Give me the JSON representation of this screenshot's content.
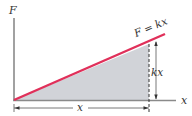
{
  "diagram": {
    "labels": {
      "y_axis": "F",
      "x_axis": "x",
      "line_equation": "F = kx",
      "height_dimension": "kx",
      "base_dimension": "x"
    },
    "colors": {
      "line": "#e0305a",
      "fill": "#c9cbd1",
      "axis": "#8a8a8a",
      "dimension": "#333333",
      "text": "#333333"
    }
  }
}
